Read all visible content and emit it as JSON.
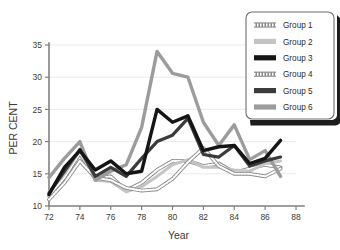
{
  "chart_data": {
    "type": "line",
    "title": "",
    "xlabel": "Year",
    "ylabel": "PER CENT",
    "xlim": [
      72,
      88
    ],
    "ylim": [
      10,
      35
    ],
    "grid": true,
    "legend_position": "top-right",
    "x": [
      72,
      73,
      74,
      75,
      76,
      77,
      78,
      79,
      80,
      81,
      82,
      83,
      84,
      85,
      86,
      87
    ],
    "xticks": [
      "72",
      "74",
      "76",
      "78",
      "80",
      "82",
      "84",
      "86",
      "88"
    ],
    "xtick_values": [
      72,
      74,
      76,
      78,
      80,
      82,
      84,
      86,
      88
    ],
    "yticks": [
      "10",
      "15",
      "20",
      "25",
      "30",
      "35"
    ],
    "ytick_values": [
      10,
      15,
      20,
      25,
      30,
      35
    ],
    "series": [
      {
        "name": "Group 1",
        "style": "hatched-light",
        "color": "#bdbdbd",
        "width": 3.2,
        "values": [
          11.6,
          14.4,
          18.2,
          14.2,
          14.6,
          12.4,
          13.6,
          15.6,
          17.0,
          17.0,
          16.2,
          16.6,
          15.2,
          15.8,
          16.4,
          16.0
        ]
      },
      {
        "name": "Group 2",
        "style": "solid-light",
        "color": "#c4c4c4",
        "width": 3.0,
        "values": [
          12.2,
          15.0,
          18.6,
          14.0,
          13.8,
          12.2,
          13.0,
          14.6,
          16.4,
          17.2,
          16.0,
          16.0,
          15.6,
          15.4,
          16.6,
          17.0
        ]
      },
      {
        "name": "Group 3",
        "style": "solid-black",
        "color": "#151515",
        "width": 3.4,
        "values": [
          11.8,
          16.0,
          18.6,
          15.6,
          17.0,
          15.0,
          15.4,
          25.0,
          23.0,
          24.0,
          18.6,
          19.2,
          19.4,
          16.6,
          17.4,
          20.2
        ]
      },
      {
        "name": "Group 4",
        "style": "hatched-light",
        "color": "#c9c9c9",
        "width": 3.2,
        "values": [
          11.0,
          13.6,
          17.0,
          14.4,
          14.0,
          12.8,
          12.4,
          12.6,
          14.2,
          16.8,
          19.0,
          16.2,
          15.0,
          15.0,
          14.6,
          15.8
        ]
      },
      {
        "name": "Group 5",
        "style": "solid-dark",
        "color": "#3b3b3b",
        "width": 3.2,
        "values": [
          12.0,
          15.4,
          18.8,
          14.6,
          16.0,
          14.6,
          17.4,
          20.0,
          21.0,
          23.6,
          18.0,
          17.6,
          19.4,
          16.2,
          17.0,
          17.6
        ]
      },
      {
        "name": "Group 6",
        "style": "solid-gray",
        "color": "#9c9c9c",
        "width": 3.4,
        "values": [
          14.4,
          17.4,
          20.0,
          14.0,
          15.4,
          16.4,
          22.2,
          34.0,
          30.6,
          30.0,
          23.0,
          19.4,
          22.6,
          17.2,
          18.6,
          14.6
        ]
      }
    ]
  },
  "legend": {
    "items": [
      "Group 1",
      "Group 2",
      "Group 3",
      "Group 4",
      "Group 5",
      "Group 6"
    ]
  }
}
